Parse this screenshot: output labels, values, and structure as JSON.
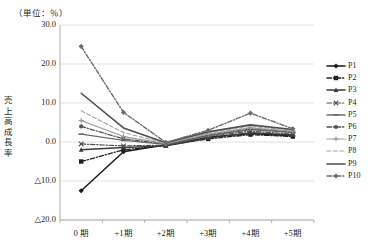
{
  "chart_data": {
    "type": "line",
    "title": "",
    "unit_note": "（単位：％）",
    "ylabel": "売上高成長率",
    "xlabel": "",
    "categories": [
      "0 期",
      "+1期",
      "+2期",
      "+3期",
      "+4期",
      "+5期"
    ],
    "ytick_labels": [
      "30.0",
      "20.0",
      "10.0",
      "0.0",
      "△10.0",
      "△20.0"
    ],
    "ytick_values": [
      30.0,
      20.0,
      10.0,
      0.0,
      -10.0,
      -20.0
    ],
    "ylim": [
      -20.0,
      30.0
    ],
    "grid": true,
    "legend_position": "right",
    "series": [
      {
        "name": "P1",
        "values": [
          -12.5,
          -2.5,
          -0.7,
          1.2,
          2.2,
          1.6
        ],
        "color": "#1b1b1b",
        "dash": "none",
        "marker": "diamond",
        "width": 1.5
      },
      {
        "name": "P2",
        "values": [
          -5.0,
          -2.0,
          -0.9,
          0.8,
          1.9,
          1.4
        ],
        "color": "#1f1f1f",
        "dash": "dashdot",
        "marker": "square",
        "width": 1.3
      },
      {
        "name": "P3",
        "values": [
          -2.0,
          -1.4,
          -1.0,
          1.0,
          2.4,
          1.8
        ],
        "color": "#3a3a3a",
        "dash": "none",
        "marker": "triangle",
        "width": 1.4
      },
      {
        "name": "P4",
        "values": [
          -0.5,
          -1.0,
          -0.8,
          1.4,
          2.8,
          2.0
        ],
        "color": "#4a4a4a",
        "dash": "dashdot",
        "marker": "cross",
        "width": 1.2
      },
      {
        "name": "P5",
        "values": [
          2.0,
          0.4,
          -0.6,
          1.6,
          3.2,
          2.4
        ],
        "color": "#6e6e6e",
        "dash": "none",
        "marker": "dash",
        "width": 1.3
      },
      {
        "name": "P6",
        "values": [
          4.0,
          0.8,
          -0.5,
          1.8,
          3.4,
          2.6
        ],
        "color": "#555555",
        "dash": "dashdot",
        "marker": "circle",
        "width": 1.3
      },
      {
        "name": "P7",
        "values": [
          5.5,
          1.4,
          -0.4,
          2.0,
          3.6,
          2.8
        ],
        "color": "#9a9a9a",
        "dash": "none",
        "marker": "plus",
        "width": 1.2
      },
      {
        "name": "P8",
        "values": [
          8.0,
          2.4,
          -0.3,
          2.2,
          4.0,
          3.0
        ],
        "color": "#a8a8a8",
        "dash": "dashed",
        "marker": "none",
        "width": 1.2
      },
      {
        "name": "P9",
        "values": [
          12.5,
          3.6,
          -0.2,
          2.6,
          4.4,
          3.2
        ],
        "color": "#4f4f4f",
        "dash": "none",
        "marker": "none",
        "width": 1.6
      },
      {
        "name": "P10",
        "values": [
          24.5,
          7.6,
          -0.1,
          3.0,
          7.4,
          3.4
        ],
        "color": "#6b6b6b",
        "dash": "dashdot",
        "marker": "diamond",
        "width": 1.4
      }
    ]
  },
  "legend": {
    "items": [
      {
        "label": "P1"
      },
      {
        "label": "P2"
      },
      {
        "label": "P3"
      },
      {
        "label": "P4"
      },
      {
        "label": "P5"
      },
      {
        "label": "P6"
      },
      {
        "label": "P7"
      },
      {
        "label": "P8"
      },
      {
        "label": "P9"
      },
      {
        "label": "P10"
      }
    ]
  },
  "colors": {
    "grid": "#d9d9d9",
    "axis": "#a6a6a6",
    "text": "#231f20"
  }
}
